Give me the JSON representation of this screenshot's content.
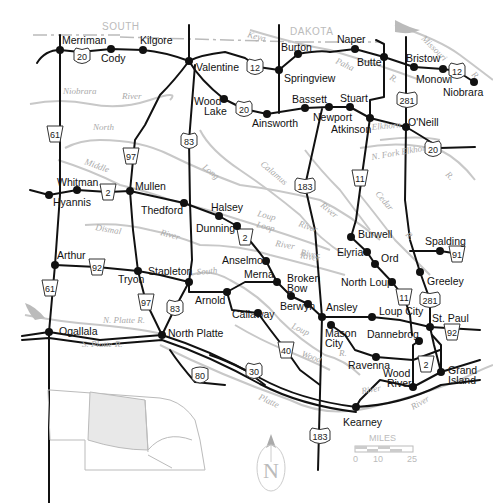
{
  "map": {
    "states": [
      {
        "label": "SOUTH",
        "x": 102,
        "y": 30
      },
      {
        "label": "DAKOTA",
        "x": 290,
        "y": 35
      }
    ],
    "towns": [
      {
        "name": "Merriman",
        "x": 60,
        "y": 50,
        "lx": 62,
        "ly": 44
      },
      {
        "name": "Cody",
        "x": 111,
        "y": 49,
        "lx": 101,
        "ly": 62
      },
      {
        "name": "Kilgore",
        "x": 143,
        "y": 50,
        "lx": 140,
        "ly": 44
      },
      {
        "name": "Valentine",
        "x": 189,
        "y": 61,
        "lx": 196,
        "ly": 71
      },
      {
        "name": "Wood Lake",
        "x": 224,
        "y": 99,
        "lx": 194,
        "ly": 105,
        "lx2": 204,
        "ly2": 115
      },
      {
        "name": "Ainsworth",
        "x": 267,
        "y": 114,
        "lx": 252,
        "ly": 127
      },
      {
        "name": "Burton",
        "x": 298,
        "y": 54,
        "lx": 281,
        "ly": 51
      },
      {
        "name": "Springview",
        "x": 279,
        "y": 70,
        "lx": 284,
        "ly": 82
      },
      {
        "name": "Naper",
        "x": 355,
        "y": 49,
        "lx": 337,
        "ly": 43
      },
      {
        "name": "Butte",
        "x": 384,
        "y": 57,
        "lx": 357,
        "ly": 66
      },
      {
        "name": "Bristow",
        "x": 414,
        "y": 67,
        "lx": 406,
        "ly": 62
      },
      {
        "name": "Monowi",
        "x": 443,
        "y": 69,
        "lx": 416,
        "ly": 83
      },
      {
        "name": "Niobrara",
        "x": 474,
        "y": 82,
        "lx": 443,
        "ly": 96
      },
      {
        "name": "Bassett",
        "x": 305,
        "y": 108,
        "lx": 292,
        "ly": 103
      },
      {
        "name": "Newport",
        "x": 329,
        "y": 107,
        "lx": 313,
        "ly": 121
      },
      {
        "name": "Stuart",
        "x": 350,
        "y": 107,
        "lx": 340,
        "ly": 102
      },
      {
        "name": "Atkinson",
        "x": 370,
        "y": 118,
        "lx": 331,
        "ly": 133
      },
      {
        "name": "O'Neill",
        "x": 406,
        "y": 127,
        "lx": 408,
        "ly": 126
      },
      {
        "name": "Whitman",
        "x": 77,
        "y": 190,
        "lx": 57,
        "ly": 186
      },
      {
        "name": "Hyannis",
        "x": 49,
        "y": 195,
        "lx": 53,
        "ly": 206
      },
      {
        "name": "Mullen",
        "x": 130,
        "y": 191,
        "lx": 135,
        "ly": 190
      },
      {
        "name": "Thedford",
        "x": 184,
        "y": 203,
        "lx": 141,
        "ly": 214
      },
      {
        "name": "Halsey",
        "x": 219,
        "y": 216,
        "lx": 211,
        "ly": 211
      },
      {
        "name": "Dunning",
        "x": 237,
        "y": 226,
        "lx": 196,
        "ly": 232
      },
      {
        "name": "Burwell",
        "x": 351,
        "y": 237,
        "lx": 358,
        "ly": 238
      },
      {
        "name": "Elyria",
        "x": 367,
        "y": 252,
        "lx": 337,
        "ly": 256
      },
      {
        "name": "Ord",
        "x": 375,
        "y": 264,
        "lx": 381,
        "ly": 262
      },
      {
        "name": "North Loup",
        "x": 392,
        "y": 282,
        "lx": 341,
        "ly": 286
      },
      {
        "name": "Spalding",
        "x": 440,
        "y": 251,
        "lx": 425,
        "ly": 245
      },
      {
        "name": "Greeley",
        "x": 420,
        "y": 272,
        "lx": 427,
        "ly": 285
      },
      {
        "name": "Arthur",
        "x": 55,
        "y": 265,
        "lx": 57,
        "ly": 259
      },
      {
        "name": "Tryon",
        "x": 138,
        "y": 271,
        "lx": 118,
        "ly": 283
      },
      {
        "name": "Stapleton",
        "x": 189,
        "y": 282,
        "lx": 148,
        "ly": 275
      },
      {
        "name": "Anselmo",
        "x": 266,
        "y": 261,
        "lx": 222,
        "ly": 264
      },
      {
        "name": "Merna",
        "x": 277,
        "y": 282,
        "lx": 244,
        "ly": 278
      },
      {
        "name": "Broken Bow",
        "x": 291,
        "y": 296,
        "lx": 287,
        "ly": 282,
        "lx2": 287,
        "ly2": 292
      },
      {
        "name": "Berwyn",
        "x": 308,
        "y": 304,
        "lx": 280,
        "ly": 310
      },
      {
        "name": "Arnold",
        "x": 227,
        "y": 292,
        "lx": 195,
        "ly": 304
      },
      {
        "name": "Callaway",
        "x": 258,
        "y": 313,
        "lx": 232,
        "ly": 318
      },
      {
        "name": "Ansley",
        "x": 322,
        "y": 317,
        "lx": 326,
        "ly": 311
      },
      {
        "name": "Mason City",
        "x": 331,
        "y": 325,
        "lx": 325,
        "ly": 337,
        "lx2": 325,
        "ly2": 347
      },
      {
        "name": "Loup City",
        "x": 372,
        "y": 317,
        "lx": 379,
        "ly": 315
      },
      {
        "name": "Dannebrog",
        "x": 419,
        "y": 341,
        "lx": 367,
        "ly": 338
      },
      {
        "name": "St. Paul",
        "x": 430,
        "y": 327,
        "lx": 432,
        "ly": 322
      },
      {
        "name": "Ravenna",
        "x": 376,
        "y": 357,
        "lx": 348,
        "ly": 369
      },
      {
        "name": "Ogallala",
        "x": 49,
        "y": 332,
        "lx": 59,
        "ly": 335
      },
      {
        "name": "North Platte",
        "x": 162,
        "y": 335,
        "lx": 168,
        "ly": 337
      },
      {
        "name": "Wood River",
        "x": 413,
        "y": 387,
        "lx": 383,
        "ly": 377,
        "lx2": 387,
        "ly2": 387
      },
      {
        "name": "Grand Island",
        "x": 441,
        "y": 372,
        "lx": 448,
        "ly": 374,
        "lx2": 448,
        "ly2": 384
      },
      {
        "name": "Kearney",
        "x": 356,
        "y": 407,
        "lx": 343,
        "ly": 426
      }
    ],
    "rivers": [
      {
        "label": "Keya",
        "x": 247,
        "y": 37,
        "rot": 15
      },
      {
        "label": "Paha",
        "x": 335,
        "y": 63,
        "rot": 25
      },
      {
        "label": "R.",
        "x": 389,
        "y": 79,
        "rot": 30
      },
      {
        "label": "Missouri",
        "x": 421,
        "y": 39,
        "rot": 45
      },
      {
        "label": "R.",
        "x": 471,
        "y": 75,
        "rot": 45
      },
      {
        "label": "Niobrara",
        "x": 63,
        "y": 94,
        "rot": 0
      },
      {
        "label": "River",
        "x": 122,
        "y": 99,
        "rot": 0
      },
      {
        "label": "North",
        "x": 93,
        "y": 130,
        "rot": 0
      },
      {
        "label": "Middle",
        "x": 84,
        "y": 164,
        "rot": 20
      },
      {
        "label": "Long",
        "x": 202,
        "y": 168,
        "rot": 40
      },
      {
        "label": "Calamus",
        "x": 260,
        "y": 165,
        "rot": 40
      },
      {
        "label": "Elkhorn",
        "x": 372,
        "y": 130,
        "rot": -5
      },
      {
        "label": "N. Fork Elkhorn",
        "x": 372,
        "y": 160,
        "rot": -10
      },
      {
        "label": "R.",
        "x": 445,
        "y": 175,
        "rot": 45
      },
      {
        "label": "Cedar",
        "x": 375,
        "y": 194,
        "rot": 50
      },
      {
        "label": "R.",
        "x": 405,
        "y": 235,
        "rot": 45
      },
      {
        "label": "River",
        "x": 320,
        "y": 206,
        "rot": 40
      },
      {
        "label": "River",
        "x": 298,
        "y": 226,
        "rot": 20
      },
      {
        "label": "Loop",
        "x": 256,
        "y": 227,
        "rot": 15
      },
      {
        "label": "River",
        "x": 275,
        "y": 246,
        "rot": 10
      },
      {
        "label": "Loup",
        "x": 257,
        "y": 216,
        "rot": 15
      },
      {
        "label": "River",
        "x": 300,
        "y": 255,
        "rot": 10
      },
      {
        "label": "Dismal",
        "x": 95,
        "y": 230,
        "rot": 10
      },
      {
        "label": "River",
        "x": 160,
        "y": 235,
        "rot": 15
      },
      {
        "label": "River",
        "x": 300,
        "y": 258,
        "rot": 10
      },
      {
        "label": "South",
        "x": 197,
        "y": 275,
        "rot": -5
      },
      {
        "label": "Loup",
        "x": 291,
        "y": 328,
        "rot": 25
      },
      {
        "label": "Wood",
        "x": 301,
        "y": 356,
        "rot": 20
      },
      {
        "label": "R.",
        "x": 339,
        "y": 356,
        "rot": 0
      },
      {
        "label": "N. Platte R.",
        "x": 103,
        "y": 323,
        "rot": 0
      },
      {
        "label": "S. Platte R.",
        "x": 82,
        "y": 347,
        "rot": 0
      },
      {
        "label": "Platte",
        "x": 258,
        "y": 399,
        "rot": 25
      },
      {
        "label": "River",
        "x": 362,
        "y": 394,
        "rot": -10
      },
      {
        "label": "River",
        "x": 413,
        "y": 410,
        "rot": -30
      }
    ],
    "shields": [
      {
        "type": "us",
        "num": "20",
        "x": 82,
        "y": 56
      },
      {
        "type": "us",
        "num": "20",
        "x": 244,
        "y": 109
      },
      {
        "type": "us",
        "num": "12",
        "x": 255,
        "y": 67
      },
      {
        "type": "us",
        "num": "12",
        "x": 457,
        "y": 71
      },
      {
        "type": "us",
        "num": "281",
        "x": 407,
        "y": 100
      },
      {
        "type": "us",
        "num": "20",
        "x": 433,
        "y": 149
      },
      {
        "type": "state",
        "num": "61",
        "x": 55,
        "y": 134
      },
      {
        "type": "state",
        "num": "97",
        "x": 131,
        "y": 156
      },
      {
        "type": "us",
        "num": "83",
        "x": 189,
        "y": 141
      },
      {
        "type": "us",
        "num": "183",
        "x": 305,
        "y": 186
      },
      {
        "type": "state",
        "num": "11",
        "x": 360,
        "y": 178
      },
      {
        "type": "state",
        "num": "2",
        "x": 108,
        "y": 192
      },
      {
        "type": "state",
        "num": "2",
        "x": 245,
        "y": 237
      },
      {
        "type": "state",
        "num": "92",
        "x": 97,
        "y": 267
      },
      {
        "type": "state",
        "num": "61",
        "x": 50,
        "y": 288
      },
      {
        "type": "state",
        "num": "97",
        "x": 146,
        "y": 302
      },
      {
        "type": "us",
        "num": "83",
        "x": 175,
        "y": 308
      },
      {
        "type": "state",
        "num": "11",
        "x": 404,
        "y": 297
      },
      {
        "type": "us",
        "num": "281",
        "x": 430,
        "y": 300
      },
      {
        "type": "state",
        "num": "91",
        "x": 457,
        "y": 254
      },
      {
        "type": "state",
        "num": "92",
        "x": 452,
        "y": 332
      },
      {
        "type": "state",
        "num": "40",
        "x": 286,
        "y": 350
      },
      {
        "type": "us",
        "num": "30",
        "x": 254,
        "y": 371
      },
      {
        "type": "interstate",
        "num": "80",
        "x": 200,
        "y": 375
      },
      {
        "type": "state",
        "num": "2",
        "x": 426,
        "y": 364
      },
      {
        "type": "us",
        "num": "183",
        "x": 320,
        "y": 436
      }
    ],
    "compass": {
      "letter": "N"
    },
    "scale": {
      "title": "MILES",
      "ticks": [
        "0",
        "10",
        "25"
      ]
    }
  }
}
